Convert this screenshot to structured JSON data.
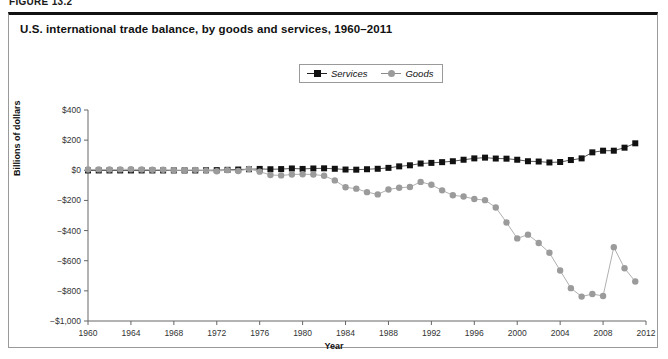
{
  "figure": {
    "kicker": "FIGURE 13.2",
    "title": "U.S. international trade balance, by goods and services, 1960–2011"
  },
  "legend": {
    "position": "top-center",
    "items": [
      {
        "label": "Services",
        "marker": "square",
        "color": "#111111"
      },
      {
        "label": "Goods",
        "marker": "circle",
        "color": "#9b9b9b"
      }
    ]
  },
  "chart_data": {
    "type": "line",
    "title": "U.S. international trade balance, by goods and services, 1960–2011",
    "xlabel": "Year",
    "ylabel": "Billions of dollars",
    "xlim": [
      1960,
      2012
    ],
    "ylim": [
      -1000,
      400
    ],
    "ytick_step": 200,
    "xtick_step": 4,
    "grid": false,
    "ytick_labels": [
      "$400",
      "$200",
      "$0",
      "−$200",
      "−$400",
      "−$600",
      "−$800",
      "−$1,000"
    ],
    "ytick_values": [
      400,
      200,
      0,
      -200,
      -400,
      -600,
      -800,
      -1000
    ],
    "xtick_labels": [
      "1960",
      "1964",
      "1968",
      "1972",
      "1976",
      "1980",
      "1984",
      "1988",
      "1992",
      "1996",
      "2000",
      "2004",
      "2008",
      "2012"
    ],
    "xtick_values": [
      1960,
      1964,
      1968,
      1972,
      1976,
      1980,
      1984,
      1988,
      1992,
      1996,
      2000,
      2004,
      2008,
      2012
    ],
    "x": [
      1960,
      1961,
      1962,
      1963,
      1964,
      1965,
      1966,
      1967,
      1968,
      1969,
      1970,
      1971,
      1972,
      1973,
      1974,
      1975,
      1976,
      1977,
      1978,
      1979,
      1980,
      1981,
      1982,
      1983,
      1984,
      1985,
      1986,
      1987,
      1988,
      1989,
      1990,
      1991,
      1992,
      1993,
      1994,
      1995,
      1996,
      1997,
      1998,
      1999,
      2000,
      2001,
      2002,
      2003,
      2004,
      2005,
      2006,
      2007,
      2008,
      2009,
      2010,
      2011
    ],
    "series": [
      {
        "name": "Services",
        "marker": "square",
        "color": "#111111",
        "values": [
          -1,
          -1,
          -1,
          -1,
          -1,
          -1,
          -1,
          -1,
          -1,
          -1,
          -1,
          0,
          1,
          3,
          5,
          7,
          9,
          7,
          8,
          12,
          9,
          12,
          13,
          10,
          5,
          4,
          7,
          10,
          16,
          26,
          33,
          45,
          49,
          54,
          60,
          70,
          79,
          84,
          78,
          77,
          70,
          60,
          58,
          52,
          55,
          68,
          79,
          119,
          130,
          130,
          150,
          179
        ]
      },
      {
        "name": "Goods",
        "marker": "circle",
        "color": "#9b9b9b",
        "values": [
          5,
          6,
          5,
          6,
          7,
          5,
          4,
          4,
          1,
          1,
          3,
          -2,
          -6,
          1,
          -5,
          9,
          -9,
          -31,
          -34,
          -28,
          -26,
          -28,
          -36,
          -67,
          -113,
          -122,
          -145,
          -160,
          -127,
          -116,
          -111,
          -77,
          -96,
          -133,
          -166,
          -174,
          -191,
          -198,
          -247,
          -346,
          -452,
          -427,
          -482,
          -547,
          -665,
          -782,
          -838,
          -821,
          -834,
          -510,
          -650,
          -738
        ]
      }
    ]
  }
}
